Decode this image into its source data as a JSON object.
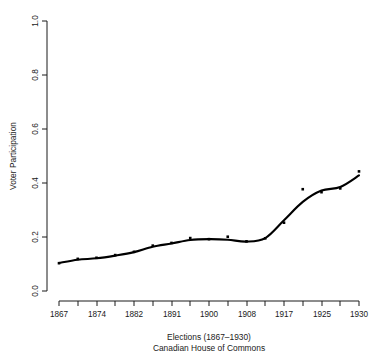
{
  "chart_data": {
    "type": "scatter",
    "title": "",
    "xlabel": "Elections (1867–1930)",
    "xlabel2": "Canadian House of Commons",
    "ylabel": "Voter Participation",
    "xlim": [
      1867,
      1930
    ],
    "ylim": [
      0.0,
      1.0
    ],
    "grid": false,
    "legend": false,
    "x_tick_labels": [
      "1867",
      "",
      "1874",
      "",
      "1882",
      "",
      "1891",
      "",
      "1900",
      "",
      "1908",
      "",
      "1917",
      "",
      "1925",
      "",
      "1930"
    ],
    "x_tick_values": [
      1867,
      1872,
      1874,
      1878,
      1882,
      1887,
      1891,
      1896,
      1900,
      1904,
      1908,
      1911,
      1917,
      1921,
      1925,
      1926,
      1930
    ],
    "y_tick_labels": [
      "0.0",
      "0.2",
      "0.4",
      "0.6",
      "0.8",
      "1.0"
    ],
    "y_tick_values": [
      0.0,
      0.2,
      0.4,
      0.6,
      0.8,
      1.0
    ],
    "x": [
      1867,
      1872,
      1874,
      1878,
      1882,
      1887,
      1891,
      1896,
      1900,
      1904,
      1908,
      1911,
      1917,
      1921,
      1925,
      1926,
      1930
    ],
    "values": [
      0.103,
      0.119,
      0.123,
      0.133,
      0.145,
      0.168,
      0.178,
      0.196,
      0.192,
      0.201,
      0.184,
      0.195,
      0.253,
      0.377,
      0.366,
      0.38,
      0.443
    ],
    "series": [
      {
        "name": "Voter Participation",
        "values": [
          0.103,
          0.119,
          0.123,
          0.133,
          0.145,
          0.168,
          0.178,
          0.196,
          0.192,
          0.201,
          0.184,
          0.195,
          0.253,
          0.377,
          0.366,
          0.38,
          0.443
        ]
      },
      {
        "name": "Smoothed trend",
        "values": [
          0.104,
          0.116,
          0.121,
          0.131,
          0.144,
          0.164,
          0.176,
          0.189,
          0.192,
          0.19,
          0.183,
          0.196,
          0.262,
          0.33,
          0.372,
          0.385,
          0.428
        ]
      }
    ],
    "point_marker": "filled-square",
    "point_color": "#000000",
    "line_color": "#000000"
  },
  "axis": {
    "y_title": "Voter Participation",
    "x_title_line1": "Elections (1867–1930)",
    "x_title_line2": "Canadian House of Commons"
  }
}
